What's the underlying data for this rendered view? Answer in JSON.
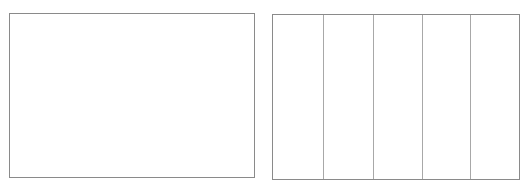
{
  "panels": [
    {
      "id": "left",
      "columns": 1
    },
    {
      "id": "right",
      "columns": 5,
      "divider_positions_px": [
        50,
        100,
        149,
        197
      ]
    }
  ],
  "colors": {
    "border": "#8a8a8a",
    "divider": "#a8a8a8",
    "background": "#ffffff"
  }
}
